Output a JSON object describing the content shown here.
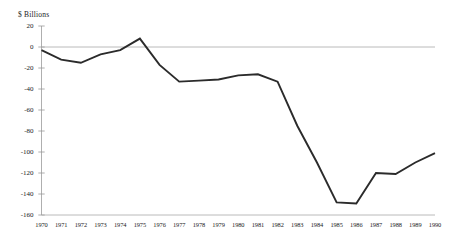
{
  "chart_data": {
    "type": "line",
    "title": "",
    "subtitle": "",
    "ylabel": "$ Billions",
    "xlabel": "",
    "ylim": [
      -160,
      20
    ],
    "xlim": [
      1970,
      1990
    ],
    "grid": false,
    "legend": null,
    "zero_line": 0,
    "yticks": [
      20,
      0,
      -20,
      -40,
      -60,
      -80,
      -100,
      -120,
      -140,
      -160
    ],
    "ytick_labels": [
      "20",
      "0",
      "-20",
      "-40",
      "-60",
      "-80",
      "-100",
      "-120",
      "-140",
      "-160"
    ],
    "categories": [
      "1970",
      "1971",
      "1972",
      "1973",
      "1974",
      "1975",
      "1976",
      "1977",
      "1978",
      "1979",
      "1980",
      "1981",
      "1982",
      "1983",
      "1984",
      "1985",
      "1986",
      "1987",
      "1988",
      "1989",
      "1990"
    ],
    "x": [
      1970,
      1971,
      1972,
      1973,
      1974,
      1975,
      1976,
      1977,
      1978,
      1979,
      1980,
      1981,
      1982,
      1983,
      1984,
      1985,
      1986,
      1987,
      1988,
      1989,
      1990
    ],
    "values": [
      -3,
      -12,
      -15,
      -7,
      -3,
      8,
      -17,
      -33,
      -32,
      -31,
      -27,
      -26,
      -33,
      -75,
      -110,
      -148,
      -149,
      -120,
      -121,
      -110,
      -101
    ],
    "series": [
      {
        "name": "deficit",
        "color": "#2b2b2b",
        "values": [
          -3,
          -12,
          -15,
          -7,
          -3,
          8,
          -17,
          -33,
          -32,
          -31,
          -27,
          -26,
          -33,
          -75,
          -110,
          -148,
          -149,
          -120,
          -121,
          -110,
          -101
        ]
      }
    ]
  },
  "axis": {
    "unit_label": "$ Billions"
  }
}
